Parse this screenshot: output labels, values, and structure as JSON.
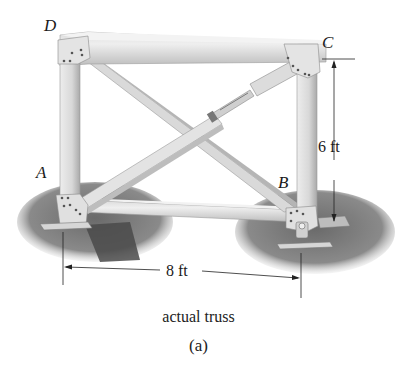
{
  "figure": {
    "subject": "actual truss",
    "joint_labels": {
      "A": "A",
      "B": "B",
      "C": "C",
      "D": "D"
    },
    "dimensions": {
      "height": "6 ft",
      "width": "8 ft"
    },
    "caption": "actual truss",
    "sublabel": "(a)"
  },
  "colors": {
    "member_light": "#e6e6e6",
    "member_mid": "#cfcfcf",
    "member_dark": "#a8a8a8",
    "shadow": "#7a7a7a",
    "ground_dark": "#5a5a5a",
    "line": "#222222"
  }
}
